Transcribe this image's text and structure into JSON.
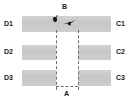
{
  "figure": {
    "title": "",
    "background_color": "#ffffff",
    "bar_color": "#c9c9c9",
    "line_color": "#6f6f6f",
    "marker_color": "#151515",
    "label_color": "#1a1a1a"
  },
  "labels": {
    "left": [
      "D1",
      "D2",
      "D3"
    ],
    "right": [
      "C1",
      "C2",
      "C3"
    ],
    "bottom_center": "A",
    "top_center": "B"
  },
  "rows": [
    {
      "left_label": "D1",
      "right_label": "C1",
      "continuous": "true",
      "segments": [
        "full-span"
      ]
    },
    {
      "left_label": "D2",
      "right_label": "C2",
      "continuous": "false",
      "segments": [
        "left",
        "right"
      ]
    },
    {
      "left_label": "D3",
      "right_label": "C3",
      "continuous": "false",
      "segments": [
        "left",
        "right"
      ]
    }
  ],
  "guides": {
    "vertical_left": "dashed",
    "vertical_right": "dashed",
    "bottom_connector": "dashed",
    "column_label": "A",
    "column_top_label": "B"
  },
  "markers": [
    {
      "name": "small-blob",
      "shape": "blob"
    },
    {
      "name": "wedge",
      "shape": "wedge"
    }
  ]
}
